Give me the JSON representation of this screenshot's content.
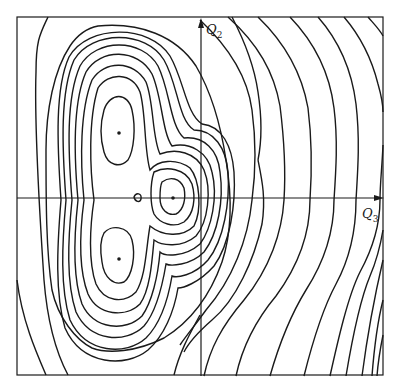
{
  "figure": {
    "type": "contour plot",
    "axes": {
      "vertical": {
        "label": "Q",
        "subscript": "2"
      },
      "horizontal": {
        "label": "Q",
        "subscript": "3"
      }
    },
    "minima_markers": 3,
    "saddle_marker": 1,
    "line_color": "#1a1a1a",
    "background": "#ffffff"
  }
}
